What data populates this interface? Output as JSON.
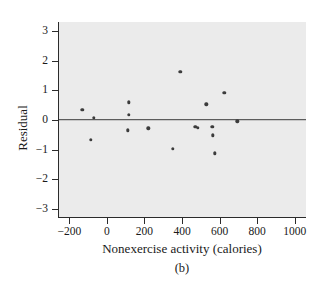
{
  "chart_data": {
    "type": "scatter",
    "title": "",
    "xlabel": "Nonexercise activity (calories)",
    "ylabel": "Residual",
    "caption": "(b)",
    "xlim": [
      -260,
      1060
    ],
    "ylim": [
      -3.3,
      3.3
    ],
    "xticks": [
      -200,
      0,
      200,
      400,
      600,
      800,
      1000
    ],
    "xtick_labels": [
      "−200",
      "0",
      "200",
      "400",
      "600",
      "800",
      "1000"
    ],
    "yticks": [
      3,
      2,
      1,
      0,
      -1,
      -2,
      -3
    ],
    "ytick_labels": [
      "3",
      "2",
      "1",
      "0",
      "−1",
      "−2",
      "−3"
    ],
    "grid": false,
    "legend": "none",
    "reference_line": {
      "y": 0,
      "orientation": "horizontal",
      "color": "#3a3a3a"
    },
    "plot_background": "#ebebeb",
    "point_color": "#3c3c3c",
    "x": [
      -135,
      -75,
      -90,
      110,
      110,
      105,
      215,
      345,
      385,
      465,
      480,
      525,
      555,
      560,
      570,
      620,
      690
    ],
    "y": [
      0.35,
      0.07,
      -0.67,
      0.6,
      0.18,
      -0.35,
      -0.28,
      -0.98,
      1.63,
      -0.22,
      -0.27,
      0.53,
      -0.22,
      -0.52,
      -1.12,
      0.92,
      -0.05
    ],
    "points": [
      {
        "x": -135,
        "y": 0.35
      },
      {
        "x": -75,
        "y": 0.07
      },
      {
        "x": -90,
        "y": -0.67
      },
      {
        "x": 110,
        "y": 0.6
      },
      {
        "x": 110,
        "y": 0.18
      },
      {
        "x": 105,
        "y": -0.35
      },
      {
        "x": 215,
        "y": -0.28
      },
      {
        "x": 345,
        "y": -0.98
      },
      {
        "x": 385,
        "y": 1.63
      },
      {
        "x": 465,
        "y": -0.22
      },
      {
        "x": 480,
        "y": -0.27
      },
      {
        "x": 525,
        "y": 0.53
      },
      {
        "x": 555,
        "y": -0.22
      },
      {
        "x": 560,
        "y": -0.52
      },
      {
        "x": 570,
        "y": -1.12
      },
      {
        "x": 620,
        "y": 0.92
      },
      {
        "x": 690,
        "y": -0.05
      }
    ]
  }
}
